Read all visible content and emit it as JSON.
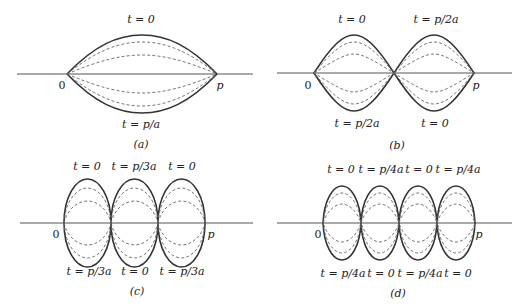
{
  "figure": {
    "panels": [
      {
        "id": "a",
        "caption": "(a)",
        "left_end": "0",
        "right_end": "p",
        "loops": 1,
        "top_labels": [
          "t = 0"
        ],
        "bottom_labels": [
          "t = p/a"
        ]
      },
      {
        "id": "b",
        "caption": "(b)",
        "left_end": "0",
        "right_end": "p",
        "loops": 2,
        "top_labels": [
          "t = 0",
          "t = p/2a"
        ],
        "bottom_labels": [
          "t = p/2a",
          "t = 0"
        ]
      },
      {
        "id": "c",
        "caption": "(c)",
        "left_end": "0",
        "right_end": "p",
        "loops": 3,
        "top_labels": [
          "t = 0",
          "t = p/3a",
          "t = 0"
        ],
        "bottom_labels": [
          "t = p/3a",
          "t = 0",
          "t = p/3a"
        ]
      },
      {
        "id": "d",
        "caption": "(d)",
        "left_end": "0",
        "right_end": "p",
        "loops": 4,
        "top_labels": [
          "t = 0",
          "t = p/4a",
          "t = 0",
          "t = p/4a"
        ],
        "bottom_labels": [
          "t = p/4a",
          "t = 0",
          "t = p/4a",
          "t = 0"
        ]
      }
    ]
  },
  "colors": {
    "background": "#ffffff",
    "curve": "#333333",
    "dashed": "#666666",
    "axis": "#555555",
    "text": "#222222"
  }
}
